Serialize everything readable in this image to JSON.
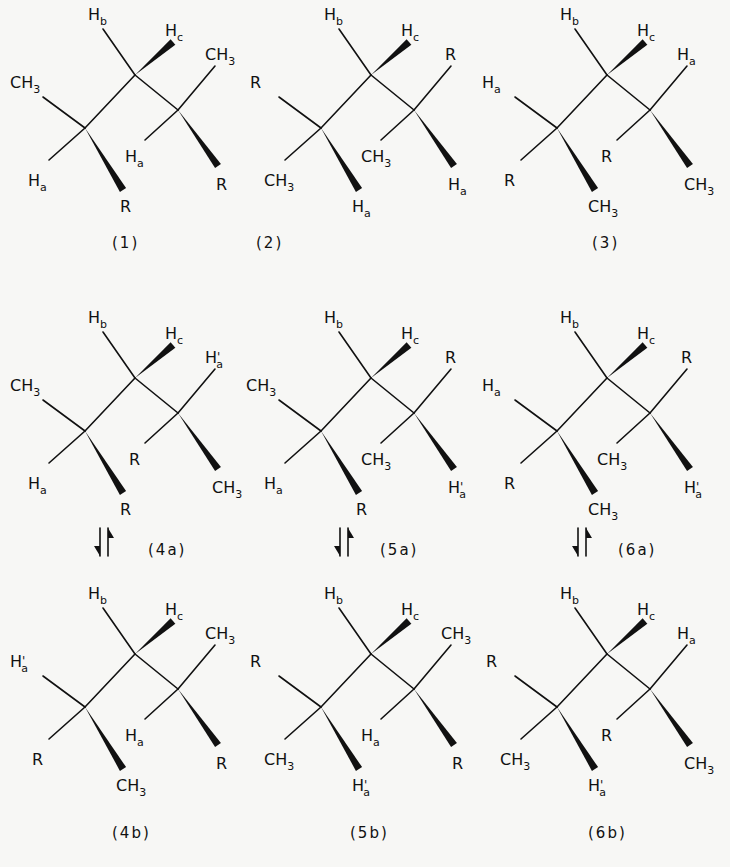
{
  "layout": {
    "column_offsets": [
      0,
      236,
      472
    ],
    "row_offsets": [
      0,
      303,
      579
    ]
  },
  "skeleton": {
    "C1": [
      85,
      128
    ],
    "C2": [
      135,
      75
    ],
    "C3": [
      178,
      110
    ],
    "positions": {
      "c1_upper_left": {
        "from": "C1",
        "to": [
          43,
          97
        ],
        "label_at": [
          10,
          88
        ],
        "type": "bond"
      },
      "c1_lower_left": {
        "from": "C1",
        "to": [
          49,
          160
        ],
        "label_at": [
          28,
          186
        ],
        "type": "bond"
      },
      "c1_down": {
        "from": "C1",
        "to": [
          123,
          190
        ],
        "label_at": [
          116,
          212
        ],
        "type": "wedge"
      },
      "c2_up": {
        "from": "C2",
        "to": [
          103,
          29
        ],
        "label_at": [
          88,
          20
        ],
        "type": "bond"
      },
      "c2_upper_right": {
        "from": "C2",
        "to": [
          173,
          42
        ],
        "label_at": [
          165,
          36
        ],
        "type": "wedge"
      },
      "c3_upper_right": {
        "from": "C3",
        "to": [
          215,
          66
        ],
        "label_at": [
          205,
          60
        ],
        "type": "bond"
      },
      "c3_lower_left": {
        "from": "C3",
        "to": [
          145,
          140
        ],
        "label_at": [
          125,
          162
        ],
        "type": "bond"
      },
      "c3_down": {
        "from": "C3",
        "to": [
          218,
          166
        ],
        "label_at": [
          212,
          190
        ],
        "type": "wedge"
      }
    }
  },
  "structures": [
    {
      "id": "1",
      "caption": "(1)",
      "row": 0,
      "col": 0,
      "labels": {
        "c1_upper_left": "CH3",
        "c1_lower_left": "Ha",
        "c1_down": "R",
        "c2_up": "Hb",
        "c2_upper_right": "Hc",
        "c3_upper_right": "CH3",
        "c3_lower_left": "Ha",
        "c3_down": "R"
      }
    },
    {
      "id": "2",
      "caption": "(2)",
      "row": 0,
      "col": 1,
      "labels": {
        "c1_upper_left": "R",
        "c1_lower_left": "CH3",
        "c1_down": "Ha",
        "c2_up": "Hb",
        "c2_upper_right": "Hc",
        "c3_upper_right": "R",
        "c3_lower_left": "CH3",
        "c3_down": "Ha"
      }
    },
    {
      "id": "3",
      "caption": "(3)",
      "row": 0,
      "col": 2,
      "labels": {
        "c1_upper_left": "Ha",
        "c1_lower_left": "R",
        "c1_down": "CH3",
        "c2_up": "Hb",
        "c2_upper_right": "Hc",
        "c3_upper_right": "Ha",
        "c3_lower_left": "R",
        "c3_down": "CH3"
      }
    },
    {
      "id": "4a",
      "caption": "(4a)",
      "row": 1,
      "col": 0,
      "labels": {
        "c1_upper_left": "CH3",
        "c1_lower_left": "Ha",
        "c1_down": "R",
        "c2_up": "Hb",
        "c2_upper_right": "Hc",
        "c3_upper_right": "H'a",
        "c3_lower_left": "R",
        "c3_down": "CH3"
      }
    },
    {
      "id": "5a",
      "caption": "(5a)",
      "row": 1,
      "col": 1,
      "labels": {
        "c1_upper_left": "CH3",
        "c1_lower_left": "Ha",
        "c1_down": "R",
        "c2_up": "Hb",
        "c2_upper_right": "Hc",
        "c3_upper_right": "R",
        "c3_lower_left": "CH3",
        "c3_down": "H'a"
      }
    },
    {
      "id": "6a",
      "caption": "(6a)",
      "row": 1,
      "col": 2,
      "labels": {
        "c1_upper_left": "Ha",
        "c1_lower_left": "R",
        "c1_down": "CH3",
        "c2_up": "Hb",
        "c2_upper_right": "Hc",
        "c3_upper_right": "R",
        "c3_lower_left": "CH3",
        "c3_down": "H'a"
      }
    },
    {
      "id": "4b",
      "caption": "(4b)",
      "row": 2,
      "col": 0,
      "labels": {
        "c1_upper_left": "H'a",
        "c1_lower_left": "R",
        "c1_down": "CH3",
        "c2_up": "Hb",
        "c2_upper_right": "Hc",
        "c3_upper_right": "CH3",
        "c3_lower_left": "Ha",
        "c3_down": "R"
      }
    },
    {
      "id": "5b",
      "caption": "(5b)",
      "row": 2,
      "col": 1,
      "labels": {
        "c1_upper_left": "R",
        "c1_lower_left": "CH3",
        "c1_down": "H'a",
        "c2_up": "Hb",
        "c2_upper_right": "Hc",
        "c3_upper_right": "CH3",
        "c3_lower_left": "Ha",
        "c3_down": "R"
      }
    },
    {
      "id": "6b",
      "caption": "(6b)",
      "row": 2,
      "col": 2,
      "labels": {
        "c1_upper_left": "R",
        "c1_lower_left": "CH3",
        "c1_down": "H'a",
        "c2_up": "Hb",
        "c2_upper_right": "Hc",
        "c3_upper_right": "Ha",
        "c3_lower_left": "R",
        "c3_down": "CH3"
      }
    }
  ],
  "captions": {
    "row0_y": 248,
    "row1_y": 555,
    "row2_y": 838,
    "positions": {
      "1": [
        112,
        248
      ],
      "2": [
        256,
        248
      ],
      "3": [
        592,
        248
      ],
      "4a": [
        148,
        555
      ],
      "5a": [
        380,
        555
      ],
      "6a": [
        618,
        555
      ],
      "4b": [
        112,
        838
      ],
      "5b": [
        350,
        838
      ],
      "6b": [
        588,
        838
      ]
    }
  },
  "equilibria": [
    {
      "between": [
        "4a",
        "4b"
      ],
      "symbol": "equilibrium-harpoons",
      "x": 100,
      "y": 542
    },
    {
      "between": [
        "5a",
        "5b"
      ],
      "symbol": "equilibrium-harpoons",
      "x": 340,
      "y": 542
    },
    {
      "between": [
        "6a",
        "6b"
      ],
      "symbol": "equilibrium-harpoons",
      "x": 578,
      "y": 542
    }
  ],
  "colors": {
    "ink": "#111111",
    "paper": "#f7f7f5"
  }
}
